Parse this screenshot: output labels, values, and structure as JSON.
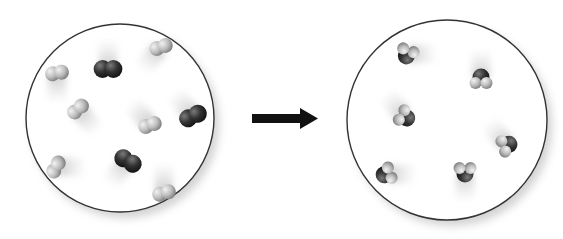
{
  "diagram": {
    "type": "chemical-reaction-particle-model",
    "arrow": {
      "direction": "right",
      "color": "#111111"
    },
    "colors": {
      "light_atom": "#bdbdbd",
      "dark_atom": "#3a3a3a",
      "circle_border": "#333333",
      "background": "#ffffff"
    },
    "reactants": {
      "circle": {
        "cx": 120,
        "cy": 118,
        "r": 94
      },
      "molecules": [
        {
          "kind": "diatomic",
          "shade": "dark",
          "x": 108,
          "y": 69,
          "angle": 0,
          "trail": "up"
        },
        {
          "kind": "diatomic",
          "shade": "light",
          "x": 161,
          "y": 47,
          "angle": -20,
          "trail": "down-left"
        },
        {
          "kind": "diatomic",
          "shade": "light",
          "x": 57,
          "y": 73,
          "angle": -10,
          "trail": "down"
        },
        {
          "kind": "diatomic",
          "shade": "light",
          "x": 78,
          "y": 109,
          "angle": -40,
          "trail": "down-right"
        },
        {
          "kind": "diatomic",
          "shade": "light",
          "x": 150,
          "y": 125,
          "angle": -20,
          "trail": "up-left"
        },
        {
          "kind": "diatomic",
          "shade": "dark",
          "x": 193,
          "y": 116,
          "angle": -25,
          "trail": "up-left"
        },
        {
          "kind": "diatomic",
          "shade": "dark",
          "x": 128,
          "y": 161,
          "angle": 30,
          "trail": "down-left"
        },
        {
          "kind": "diatomic",
          "shade": "light",
          "x": 56,
          "y": 167,
          "angle": -60,
          "trail": "right"
        },
        {
          "kind": "diatomic",
          "shade": "light",
          "x": 164,
          "y": 193,
          "angle": -15,
          "trail": "up"
        }
      ]
    },
    "products": {
      "circle": {
        "cx": 447,
        "cy": 120,
        "r": 100
      },
      "molecules": [
        {
          "kind": "bent-triatomic",
          "x": 407,
          "y": 54,
          "angle": 200,
          "trail": "right"
        },
        {
          "kind": "bent-triatomic",
          "x": 481,
          "y": 79,
          "angle": 0,
          "trail": "up"
        },
        {
          "kind": "bent-triatomic",
          "x": 405,
          "y": 117,
          "angle": 120,
          "trail": "up-left"
        },
        {
          "kind": "bent-triatomic",
          "x": 507,
          "y": 145,
          "angle": 70,
          "trail": "up-left"
        },
        {
          "kind": "bent-triatomic",
          "x": 386,
          "y": 174,
          "angle": 250,
          "trail": "right"
        },
        {
          "kind": "bent-triatomic",
          "x": 465,
          "y": 172,
          "angle": 180,
          "trail": "down"
        }
      ]
    }
  }
}
